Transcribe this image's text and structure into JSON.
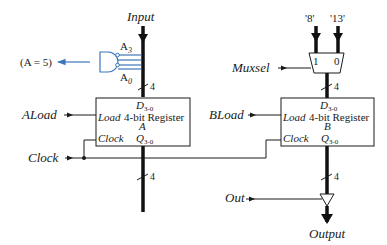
{
  "diagram": {
    "colors": {
      "line": "#1a1a1a",
      "accent_blue": "#3a76b8",
      "background": "#ffffff"
    },
    "inputs": {
      "input_bus": "Input",
      "aload": "ALoad",
      "clock": "Clock",
      "muxsel": "Muxsel",
      "bload": "BLoad",
      "out": "Out"
    },
    "outputs": {
      "output_bus": "Output",
      "compare": "(A = 5)"
    },
    "and_gate": {
      "top_bit": "A",
      "top_sub": "3",
      "bottom_bit": "A",
      "bottom_sub": "0"
    },
    "mux": {
      "input_left_const": "'8'",
      "input_right_const": "'13'",
      "sel1_label": "1",
      "sel0_label": "0"
    },
    "register_a": {
      "d_label": "D",
      "d_sub": "3-0",
      "load_label": "Load",
      "name": "4-bit Register",
      "letter": "A",
      "clock_label": "Clock",
      "q_label": "Q",
      "q_sub": "3-0"
    },
    "register_b": {
      "d_label": "D",
      "d_sub": "3-0",
      "load_label": "Load",
      "name": "4-bit Register",
      "letter": "B",
      "clock_label": "Clock",
      "q_label": "Q",
      "q_sub": "3-0"
    },
    "bus_widths": {
      "input_to_a": "4",
      "a_output": "4",
      "mux_to_b": "4",
      "b_output": "4"
    }
  }
}
